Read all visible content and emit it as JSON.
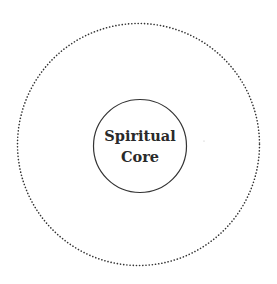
{
  "diagram": {
    "outer_circle": {
      "style": "dotted",
      "color": "#333333"
    },
    "inner_circle": {
      "style": "solid",
      "color": "#333333",
      "label_lines": [
        "Spiritual",
        "Core"
      ]
    }
  }
}
